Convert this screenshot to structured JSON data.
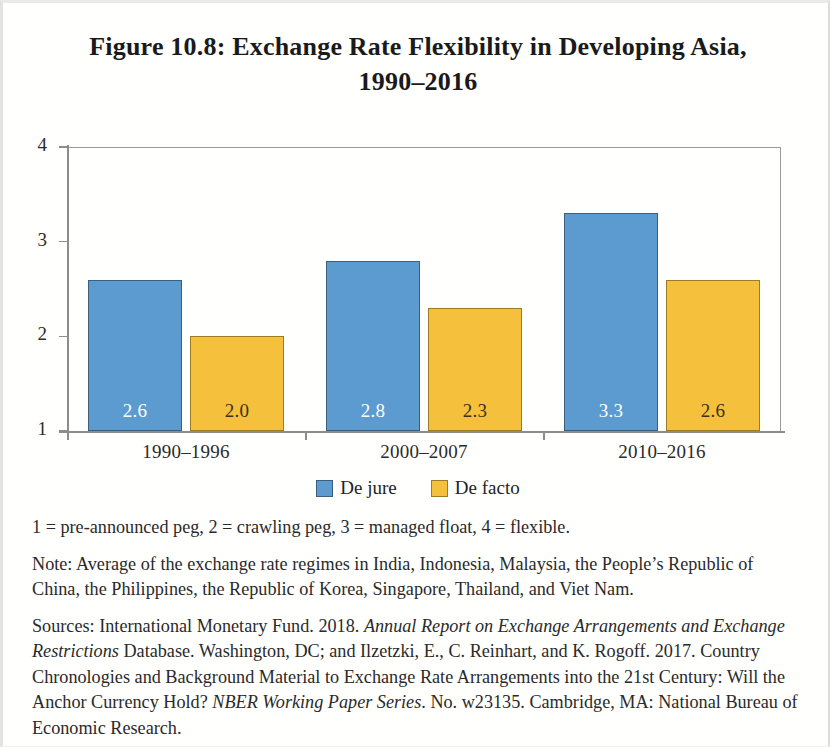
{
  "figure": {
    "title_line1": "Figure 10.8: Exchange Rate Flexibility in Developing Asia,",
    "title_line2": "1990–2016"
  },
  "chart_data": {
    "type": "bar",
    "title": "Figure 10.8: Exchange Rate Flexibility in Developing Asia, 1990–2016",
    "xlabel": "",
    "ylabel": "",
    "ylim": [
      1,
      4
    ],
    "yticks": [
      "1",
      "2",
      "3",
      "4"
    ],
    "grid": false,
    "legend_position": "bottom-center",
    "categories": [
      "1990–1996",
      "2000–2007",
      "2010–2016"
    ],
    "series": [
      {
        "name": "De jure",
        "color": "#5B9BD0",
        "label_color": "#ffffff",
        "values": [
          2.6,
          2.8,
          3.3
        ],
        "value_labels": [
          "2.6",
          "2.8",
          "3.3"
        ]
      },
      {
        "name": "De facto",
        "color": "#F5C13D",
        "label_color": "#3b2f16",
        "values": [
          2.0,
          2.3,
          2.6
        ],
        "value_labels": [
          "2.0",
          "2.3",
          "2.6"
        ]
      }
    ]
  },
  "legend": {
    "items": [
      {
        "label": "De jure",
        "color": "#5B9BD0"
      },
      {
        "label": "De facto",
        "color": "#F5C13D"
      }
    ]
  },
  "notes": {
    "scale": "1 = pre-announced peg, 2 = crawling peg, 3 = managed float, 4 = flexible.",
    "note": "Note: Average of the exchange rate regimes in India, Indonesia, Malaysia, the People’s Republic of China, the Philippines, the Republic of Korea, Singapore, Thailand, and Viet Nam.",
    "sources_part1": "Sources: International Monetary Fund. 2018. ",
    "sources_italic1": "Annual Report on Exchange Arrangements and Exchange Restrictions",
    "sources_part2": " Database. Washington, DC; and Ilzetzki, E., C. Reinhart, and K. Rogoff. 2017. Country Chronologies and Background Material to Exchange Rate Arrangements into the 21st Century: Will the Anchor Currency Hold? ",
    "sources_italic2": "NBER Working Paper Series",
    "sources_part3": ". No. w23135. Cambridge, MA: National Bureau of Economic Research."
  }
}
